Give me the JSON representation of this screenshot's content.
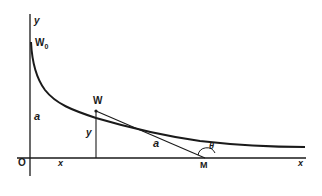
{
  "figure": {
    "colors": {
      "ink": "#1a1a1a",
      "background": "#ffffff"
    },
    "labels": {
      "y_axis": "y",
      "x_axis": "x",
      "origin": "O",
      "start_point": "W",
      "start_point_sub": "0",
      "point": "W",
      "height_a": "a",
      "ordinate_y": "y",
      "abscissa_x": "x",
      "tangent_length": "a",
      "foot_point": "M",
      "angle": "θ"
    }
  }
}
